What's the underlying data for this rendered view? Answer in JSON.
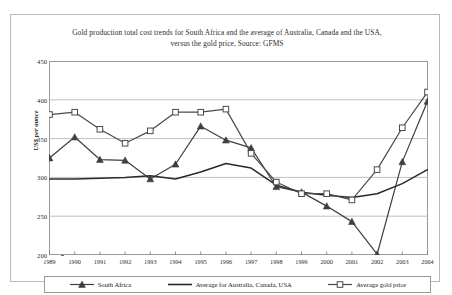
{
  "chart_data": {
    "type": "line",
    "title": "Gold production total cost trends for South Africa and the average of Australia, Canada and the USA, versus the gold price, Source: GFMS",
    "title_line1": "Gold production total cost trends for South Africa and the average of Australia, Canada and the USA,",
    "title_line2": "versus the gold price, Source: GFMS",
    "xlabel": "",
    "ylabel": "US$ per ounce",
    "ylim": [
      200,
      450
    ],
    "yticks": [
      450,
      400,
      350,
      300,
      250,
      200
    ],
    "grid": true,
    "legend_position": "bottom",
    "categories": [
      "1989",
      "1990",
      "1991",
      "1992",
      "1993",
      "1994",
      "1995",
      "1996",
      "1997",
      "1998",
      "1999",
      "2000",
      "2001",
      "2002",
      "2003",
      "2004"
    ],
    "series": [
      {
        "name": "South Africa",
        "marker": "filled-triangle",
        "color": "#3f3f3f",
        "values": [
          325,
          352,
          323,
          322,
          298,
          317,
          366,
          348,
          338,
          288,
          281,
          263,
          243,
          201,
          320,
          398
        ]
      },
      {
        "name": "Average for Australia, Canada, USA",
        "marker": "none",
        "color": "#2a2a2a",
        "values": [
          298,
          298,
          299,
          300,
          302,
          298,
          307,
          318,
          312,
          290,
          281,
          277,
          274,
          279,
          292,
          310
        ]
      },
      {
        "name": "Average gold price",
        "marker": "open-square",
        "color": "#4a4a4a",
        "values": [
          381,
          384,
          362,
          344,
          360,
          384,
          384,
          388,
          331,
          294,
          279,
          279,
          271,
          310,
          364,
          410
        ]
      }
    ]
  },
  "legend": {
    "items": [
      {
        "label": "South Africa",
        "icon": "filled-triangle-marker-icon"
      },
      {
        "label": "Average for Australia, Canada, USA",
        "icon": "plain-line-icon"
      },
      {
        "label": "Average gold price",
        "icon": "open-square-marker-icon"
      }
    ]
  }
}
